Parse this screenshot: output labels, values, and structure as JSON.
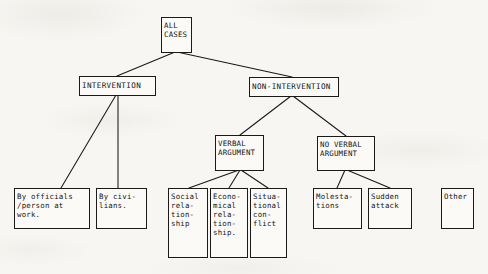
{
  "diagram": {
    "title_text": "ALL CASES",
    "background_color": "#f7f6f2",
    "ink_color": "#141414",
    "nodes": {
      "all_cases": "ALL\nCASES",
      "intervention": "INTERVENTION",
      "non_intervention": "NON-INTERVENTION",
      "verbal_argument": "VERBAL\nARGUMENT",
      "no_verbal_argument": "NO VERBAL\nARGUMENT",
      "by_officials": "By officials\n/person at\nwork.",
      "by_civilians": "By civi-\nlians.",
      "social_relationship": "Social\nrela-\ntion-\nship",
      "economical_relationship": "Econo-\nmical\nrela-\ntion-\nship.",
      "situational_conflict": "Situa-\ntional\ncon-\nflict",
      "molestations": "Molesta-\ntions",
      "sudden_attack": "Sudden\nattack",
      "other": "Other"
    }
  }
}
